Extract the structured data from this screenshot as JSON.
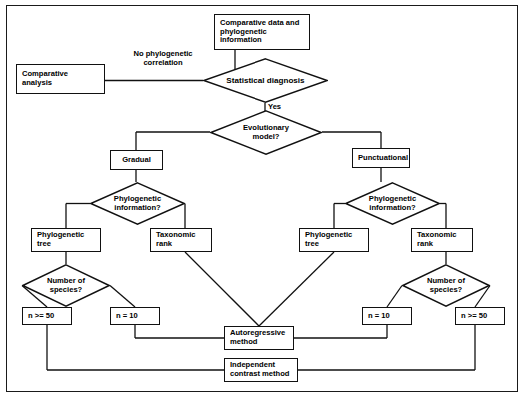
{
  "diagram": {
    "style": {
      "line_color": "#111111",
      "fill_color": "#ffffff",
      "text_color": "#000000"
    },
    "nodes": [
      {
        "id": "data_source",
        "shape": "box",
        "text": "Comparative data and phylogenetic information"
      },
      {
        "id": "stat_diag",
        "shape": "diamond",
        "text": "Statistical diagnosis"
      },
      {
        "id": "comp_analysis",
        "shape": "box",
        "text": "Comparative analysis"
      },
      {
        "id": "evo_model",
        "shape": "diamond",
        "text": "Evolutionary model?"
      },
      {
        "id": "gradual",
        "shape": "box",
        "text": "Gradual"
      },
      {
        "id": "punctuational",
        "shape": "box",
        "text": "Punctuational"
      },
      {
        "id": "phylo_info_l",
        "shape": "diamond",
        "text": "Phylogenetic information?"
      },
      {
        "id": "phylo_info_r",
        "shape": "diamond",
        "text": "Phylogenetic information?"
      },
      {
        "id": "phylo_tree_l",
        "shape": "box",
        "text": "Phylogenetic tree"
      },
      {
        "id": "tax_rank_l",
        "shape": "box",
        "text": "Taxonomic rank"
      },
      {
        "id": "phylo_tree_r",
        "shape": "box",
        "text": "Phylogenetic tree"
      },
      {
        "id": "tax_rank_r",
        "shape": "box",
        "text": "Taxonomic rank"
      },
      {
        "id": "num_species_l",
        "shape": "diamond",
        "text": "Number of species?"
      },
      {
        "id": "num_species_r",
        "shape": "diamond",
        "text": "Number of species?"
      },
      {
        "id": "n50_l",
        "shape": "box",
        "text": "n >= 50"
      },
      {
        "id": "n10_l",
        "shape": "box",
        "text": "n = 10"
      },
      {
        "id": "n10_r",
        "shape": "box",
        "text": "n = 10"
      },
      {
        "id": "n50_r",
        "shape": "box",
        "text": "n >= 50"
      },
      {
        "id": "autoreg",
        "shape": "box",
        "text": "Autoregressive method"
      },
      {
        "id": "indep",
        "shape": "box",
        "text": "Independent contrast method"
      }
    ],
    "edge_labels": [
      {
        "id": "no_phylo_corr",
        "text": "No phylogenetic correlation"
      },
      {
        "id": "yes",
        "text": "Yes"
      }
    ]
  },
  "labels": {
    "data_source_l1": "Comparative data and",
    "data_source_l2": "phylogenetic",
    "data_source_l3": "information",
    "stat_diag": "Statistical diagnosis",
    "comp_analysis_l1": "Comparative",
    "comp_analysis_l2": "analysis",
    "no_phylo_corr_l1": "No phylogenetic",
    "no_phylo_corr_l2": "correlation",
    "yes": "Yes",
    "evo_model_l1": "Evolutionary",
    "evo_model_l2": "model?",
    "gradual": "Gradual",
    "punctuational": "Punctuational",
    "phylo_info_l1": "Phylogenetic",
    "phylo_info_l2": "information?",
    "phylo_tree_l1": "Phylogenetic",
    "phylo_tree_l2": "tree",
    "tax_rank_l1": "Taxonomic",
    "tax_rank_l2": "rank",
    "num_species_l1": "Number of",
    "num_species_l2": "species?",
    "n50": "n >= 50",
    "n10": "n = 10",
    "autoreg_l1": "Autoregressive",
    "autoreg_l2": "method",
    "indep_l1": "Independent",
    "indep_l2": "contrast method"
  }
}
